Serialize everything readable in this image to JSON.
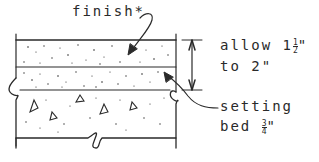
{
  "diagram": {
    "type": "section-detail",
    "colors": {
      "ink": "#2a2a2a",
      "background": "#ffffff"
    },
    "labels": {
      "finish": "finish*",
      "allow_line1_prefix": "allow 1",
      "allow_frac_num": "1",
      "allow_frac_den": "2",
      "allow_line1_suffix": "\"",
      "allow_line2": "to 2\"",
      "setting_line1": "setting",
      "setting_line2_prefix": "bed ",
      "setting_frac_num": "3",
      "setting_frac_den": "4",
      "setting_line2_suffix": "\""
    },
    "layers": [
      {
        "name": "finish",
        "pattern": "stipple"
      },
      {
        "name": "setting-bed",
        "pattern": "stipple"
      },
      {
        "name": "concrete-slab",
        "pattern": "aggregate-triangles"
      }
    ],
    "dimension": {
      "text": "allow 1½\" to 2\"",
      "spans": [
        "finish",
        "setting-bed"
      ]
    },
    "leaders": [
      {
        "label": "finish*",
        "points_to": "finish"
      },
      {
        "label": "setting bed ¾\"",
        "points_to": "setting-bed"
      }
    ]
  }
}
